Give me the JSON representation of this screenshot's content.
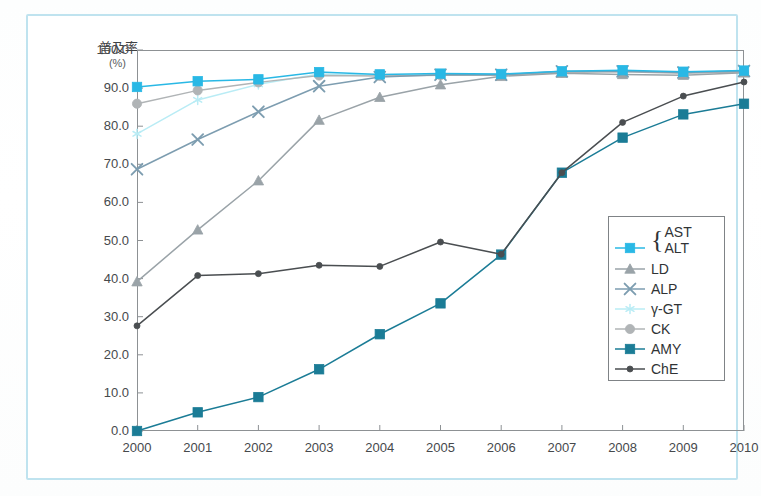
{
  "figure": {
    "y_axis_title": "普及率",
    "y_axis_unit": "(%)"
  },
  "colors": {
    "page_frame": "#bfe3ef",
    "plot_frame": "#8d9194",
    "ast_alt": "#29b8e5",
    "ld": "#9aa3a8",
    "alp": "#7d9db0",
    "ggt": "#b9ecf5",
    "ck": "#b0b4b6",
    "amy": "#1b7c96",
    "che": "#4a4e51"
  },
  "legend": {
    "position": "bottom-right",
    "brace": "{",
    "entries": [
      {
        "label": "AST",
        "label2": "ALT",
        "key": "ast_alt",
        "marker": "square",
        "color": "#29b8e5",
        "braced": true
      },
      {
        "label": "LD",
        "key": "ld",
        "marker": "triangle",
        "color": "#9aa3a8",
        "braced": false
      },
      {
        "label": "ALP",
        "key": "alp",
        "marker": "cross",
        "color": "#7d9db0",
        "braced": false
      },
      {
        "label": "γ-GT",
        "key": "ggt",
        "marker": "star",
        "color": "#b9ecf5",
        "braced": false
      },
      {
        "label": "CK",
        "key": "ck",
        "marker": "circle",
        "color": "#b0b4b6",
        "braced": false
      },
      {
        "label": "AMY",
        "key": "amy",
        "marker": "square",
        "color": "#1b7c96",
        "braced": false
      },
      {
        "label": "ChE",
        "key": "che",
        "marker": "dot",
        "color": "#4a4e51",
        "braced": false
      }
    ]
  },
  "chart_data": {
    "type": "line",
    "title": "",
    "xlabel": "",
    "ylabel": "普及率 (%)",
    "grid": false,
    "legend_position": "bottom-right",
    "categories": [
      "2000",
      "2001",
      "2002",
      "2003",
      "2004",
      "2005",
      "2006",
      "2007",
      "2008",
      "2009",
      "2010"
    ],
    "x": [
      2000,
      2001,
      2002,
      2003,
      2004,
      2005,
      2006,
      2007,
      2008,
      2009,
      2010
    ],
    "xlim": [
      2000,
      2010
    ],
    "ylim": [
      0.0,
      100.0
    ],
    "ytick_labels": [
      "0.0",
      "10.0",
      "20.0",
      "30.0",
      "40.0",
      "50.0",
      "60.0",
      "70.0",
      "80.0",
      "90.0",
      "100.0"
    ],
    "yticks": [
      0.0,
      10.0,
      20.0,
      30.0,
      40.0,
      50.0,
      60.0,
      70.0,
      80.0,
      90.0,
      100.0
    ],
    "series": [
      {
        "name": "AST\nALT",
        "key": "ast_alt",
        "marker": "square",
        "color": "#29b8e5",
        "values": [
          90.3,
          91.8,
          92.3,
          94.2,
          93.6,
          93.8,
          93.7,
          94.4,
          94.7,
          94.3,
          94.6
        ]
      },
      {
        "name": "LD",
        "key": "ld",
        "marker": "triangle",
        "color": "#9aa3a8",
        "values": [
          39.2,
          52.8,
          65.7,
          81.6,
          87.6,
          90.9,
          93.1,
          93.9,
          93.6,
          93.4,
          94.0
        ]
      },
      {
        "name": "ALP",
        "key": "alp",
        "marker": "cross",
        "color": "#7d9db0",
        "values": [
          68.7,
          76.5,
          83.8,
          90.5,
          92.9,
          93.5,
          93.5,
          94.4,
          94.4,
          94.1,
          94.5
        ]
      },
      {
        "name": "γ-GT",
        "key": "ggt",
        "marker": "star",
        "color": "#b9ecf5",
        "values": [
          78.0,
          86.9,
          91.0,
          93.7,
          93.4,
          93.6,
          93.5,
          94.2,
          94.5,
          94.1,
          94.4
        ]
      },
      {
        "name": "CK",
        "key": "ck",
        "marker": "circle",
        "color": "#b0b4b6",
        "values": [
          85.9,
          89.4,
          91.5,
          93.3,
          93.2,
          93.4,
          93.4,
          94.1,
          94.3,
          93.9,
          94.2
        ]
      },
      {
        "name": "AMY",
        "key": "amy",
        "marker": "square",
        "color": "#1b7c96",
        "values": [
          0.0,
          4.9,
          8.9,
          16.2,
          25.4,
          33.5,
          46.3,
          67.8,
          77.0,
          83.1,
          85.9
        ]
      },
      {
        "name": "ChE",
        "key": "che",
        "marker": "dot",
        "color": "#4a4e51",
        "values": [
          27.6,
          40.8,
          41.3,
          43.5,
          43.2,
          49.6,
          46.4,
          67.8,
          81.0,
          87.9,
          91.6
        ]
      }
    ]
  }
}
